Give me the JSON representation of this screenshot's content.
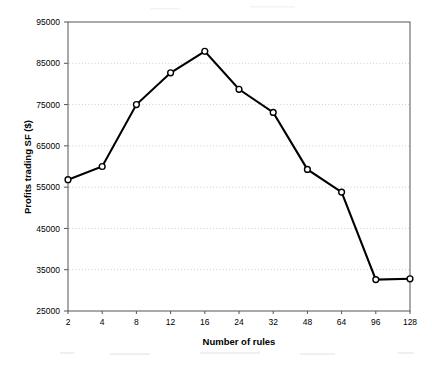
{
  "chart_data": {
    "type": "line",
    "title": "",
    "subtitle": "",
    "xlabel": "Number of rules",
    "ylabel": "Profits trading SF ($)",
    "categories": [
      "2",
      "4",
      "8",
      "12",
      "16",
      "24",
      "32",
      "48",
      "64",
      "96",
      "128"
    ],
    "x_tick_labels": [
      "2",
      "4",
      "8",
      "12",
      "16",
      "24",
      "32",
      "48",
      "64",
      "96",
      "128"
    ],
    "y_tick_labels": [
      "25000",
      "35000",
      "45000",
      "55000",
      "65000",
      "75000",
      "85000",
      "95000"
    ],
    "y_ticks": [
      25000,
      35000,
      45000,
      55000,
      65000,
      75000,
      85000,
      95000
    ],
    "ylim": [
      25000,
      95000
    ],
    "xlim_index": [
      0,
      10
    ],
    "grid": "horizontal-dotted",
    "legend": "none",
    "series": [
      {
        "name": "Profits trading SF ($)",
        "marker": "open-circle",
        "line_color": "#000000",
        "marker_fill": "#ffffff",
        "values": [
          56800,
          60000,
          75000,
          82700,
          87900,
          78700,
          73100,
          59300,
          53800,
          32600,
          32800
        ]
      }
    ],
    "annotations": []
  },
  "style": {
    "background": "#ffffff",
    "axis_color": "#555555",
    "grid_color": "#bfbfc4",
    "text_color": "#000000",
    "line_color": "#000000",
    "marker_fill": "#ffffff"
  },
  "geometry": {
    "plot_left": 68,
    "plot_right": 410,
    "plot_top": 22,
    "plot_bottom": 311
  }
}
